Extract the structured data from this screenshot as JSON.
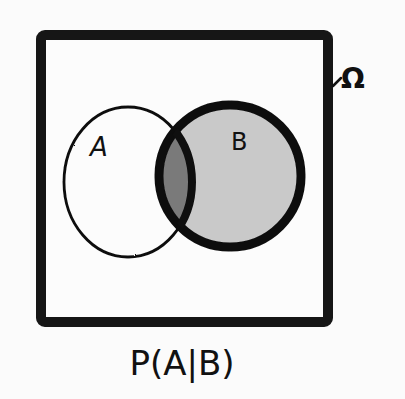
{
  "diagram": {
    "type": "venn",
    "universe": {
      "label": "Ω",
      "stroke": "#141414",
      "fill": "#fcfcfc"
    },
    "sets": [
      {
        "name": "A",
        "label": "A",
        "fill": "#fbfbfb",
        "stroke": "#111111",
        "emphasized": false
      },
      {
        "name": "B",
        "label": "B",
        "fill": "#c9c9c9",
        "stroke": "#0f0f0f",
        "emphasized": true
      }
    ],
    "intersection": {
      "sets": [
        "A",
        "B"
      ],
      "fill": "#7a7a7a"
    },
    "caption": "P(A|B)"
  }
}
